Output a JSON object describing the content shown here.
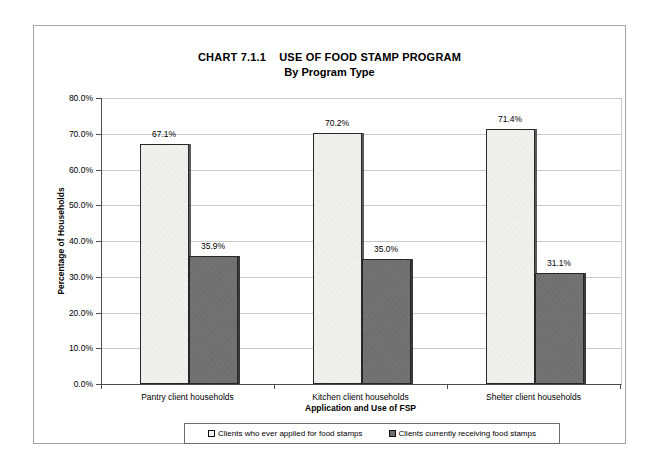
{
  "chart": {
    "frame": "scanned-report-page"
  },
  "chart_data": {
    "type": "bar",
    "title": "CHART 7.1.1    USE OF FOOD STAMP PROGRAM",
    "subtitle": "By Program Type",
    "categories": [
      "Pantry client households",
      "Kitchen client households",
      "Shelter client households"
    ],
    "series": [
      {
        "name": "Clients who ever applied for food stamps",
        "values": [
          67.1,
          70.2,
          71.4
        ],
        "labels": [
          "67.1%",
          "70.2%",
          "71.4%"
        ],
        "color": "#f1f1ee"
      },
      {
        "name": "Clients currently receiving food stamps",
        "values": [
          35.9,
          35.0,
          31.1
        ],
        "labels": [
          "35.9%",
          "35.0%",
          "31.1%"
        ],
        "color": "#6e6e6e"
      }
    ],
    "xlabel": "Application and Use of FSP",
    "ylabel": "Percentage of Households",
    "ylim": [
      0,
      80
    ],
    "ytick_step": 10,
    "yticks": [
      "0.0%",
      "10.0%",
      "20.0%",
      "30.0%",
      "40.0%",
      "50.0%",
      "60.0%",
      "70.0%",
      "80.0%"
    ],
    "grid": true,
    "legend_position": "bottom",
    "colors": {
      "gridline": "#c9c9c9",
      "axis": "#4d4d4d",
      "series0_fill": "#f1f1ee",
      "series1_fill": "#6e6e6e"
    }
  }
}
